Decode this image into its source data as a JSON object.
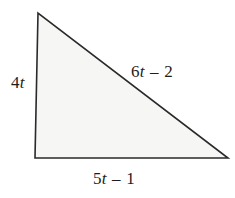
{
  "figure": {
    "type": "right-triangle-diagram",
    "background_color": "#ffffff",
    "fill_color": "#f6f6f4",
    "stroke_color": "#2a2a2a",
    "stroke_width": 1.5,
    "vertices": {
      "apex": [
        38,
        13
      ],
      "bottom_left": [
        35,
        158
      ],
      "bottom_right": [
        228,
        158
      ]
    }
  },
  "labels": {
    "left_leg": {
      "text": "4t",
      "coefficient": "4",
      "variable": "t",
      "operator": "",
      "constant": ""
    },
    "hypotenuse": {
      "text": "6t – 2",
      "coefficient": "6",
      "variable": "t",
      "operator": "–",
      "constant": "2"
    },
    "bottom_leg": {
      "text": "5t – 1",
      "coefficient": "5",
      "variable": "t",
      "operator": "–",
      "constant": "1"
    }
  }
}
